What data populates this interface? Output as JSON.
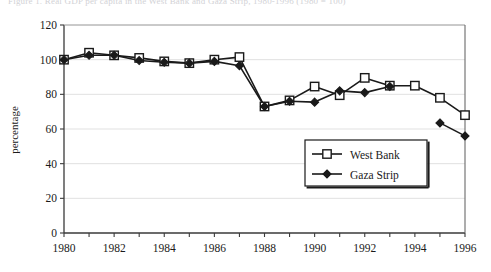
{
  "ghost_caption": "Figure 1.  Real GDP per capita in the West Bank and Gaza Strip, 1980-1996 (1980 = 100)",
  "chart_data": {
    "type": "line",
    "title": "",
    "xlabel": "",
    "ylabel": "percentage",
    "xlim": [
      1980,
      1996
    ],
    "ylim": [
      0,
      120
    ],
    "ytick_step": 20,
    "yticks": [
      "0",
      "20",
      "40",
      "60",
      "80",
      "100",
      "120"
    ],
    "xticks_major": [
      "1980",
      "1982",
      "1984",
      "1986",
      "1988",
      "1990",
      "1992",
      "1994",
      "1996"
    ],
    "xticks_minor_every": 1,
    "grid": "horizontal",
    "legend_position": "inside-lower-right",
    "x": [
      1980,
      1981,
      1982,
      1983,
      1984,
      1985,
      1986,
      1987,
      1988,
      1989,
      1990,
      1991,
      1992,
      1993,
      1994,
      1995,
      1996
    ],
    "series": [
      {
        "name": "West Bank",
        "marker": "open-square",
        "color": "#1a1a1a",
        "values": [
          100,
          104,
          102.5,
          101,
          99,
          98,
          100,
          101.5,
          73,
          76.5,
          84.5,
          79.5,
          89.5,
          85,
          85,
          78,
          68
        ]
      },
      {
        "name": "Gaza Strip",
        "marker": "filled-diamond",
        "color": "#1a1a1a",
        "values": [
          100,
          102.5,
          102.5,
          99.5,
          98.5,
          98,
          99,
          96.5,
          73,
          76,
          75.5,
          82,
          81,
          84.5,
          null,
          63.5,
          56
        ]
      }
    ]
  },
  "legend": {
    "items": [
      {
        "label": "West Bank",
        "marker": "open-square"
      },
      {
        "label": "Gaza Strip",
        "marker": "filled-diamond"
      }
    ]
  }
}
